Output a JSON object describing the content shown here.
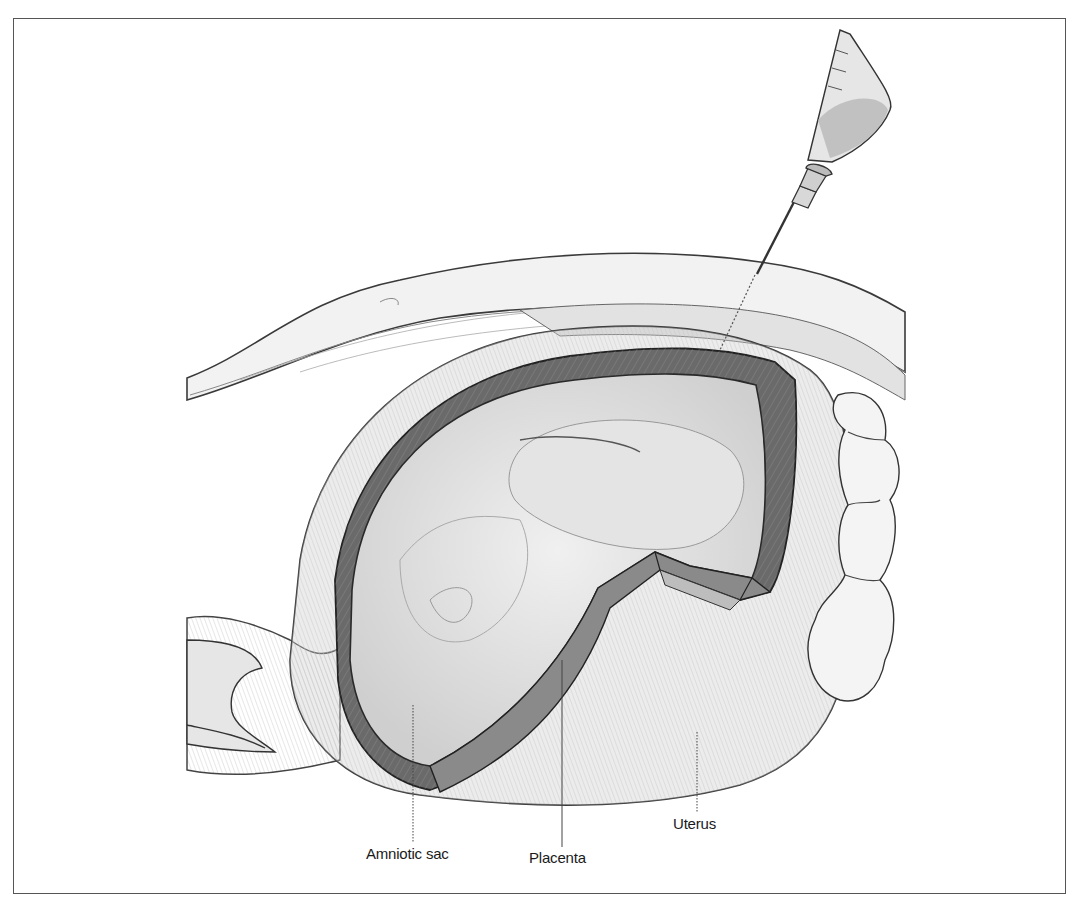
{
  "figure": {
    "labels": [
      {
        "id": "amniotic-sac",
        "text": "Amniotic sac",
        "leader": {
          "x": 413,
          "y1": 705,
          "y2": 845,
          "style": "dotted"
        },
        "pos": {
          "left": 366,
          "top": 845
        }
      },
      {
        "id": "placenta",
        "text": "Placenta",
        "leader": {
          "x": 562,
          "y1": 660,
          "y2": 848,
          "style": "solid"
        },
        "pos": {
          "left": 529,
          "top": 849
        }
      },
      {
        "id": "uterus",
        "text": "Uterus",
        "leader": {
          "x": 697,
          "y1": 732,
          "y2": 815,
          "style": "dotted"
        },
        "pos": {
          "left": 673,
          "top": 815
        }
      }
    ],
    "colors": {
      "ink": "#2a2a2a",
      "placenta": "#6e6e6e",
      "uterus_wall": "#b4b4b4",
      "fluid": "#d6d6d6",
      "skin": "#eeeeee",
      "frame": "#555555"
    }
  }
}
